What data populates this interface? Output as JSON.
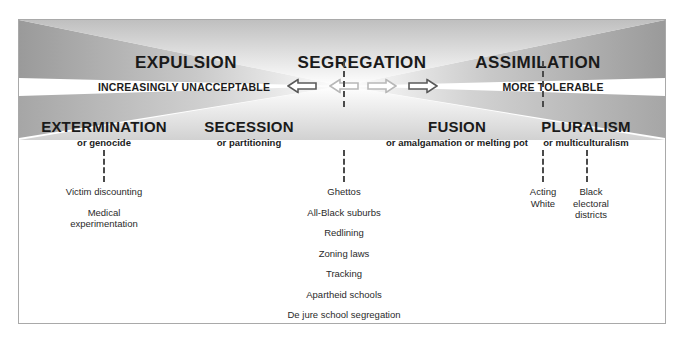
{
  "diagram": {
    "title_row": [
      {
        "label": "EXPULSION",
        "x": 167,
        "y": 44
      },
      {
        "label": "SEGREGATION",
        "x": 343,
        "y": 44
      },
      {
        "label": "ASSIMILATION",
        "x": 519,
        "y": 44
      }
    ],
    "scale_labels": [
      {
        "label": "INCREASINGLY UNACCEPTABLE",
        "x": 165,
        "y": 84
      },
      {
        "label": "MORE TOLERABLE",
        "x": 534,
        "y": 84
      }
    ],
    "arrows": [
      {
        "name": "arrow-left-outer",
        "direction": "left",
        "x": 283,
        "y": 85,
        "tone": "dark"
      },
      {
        "name": "arrow-left-inner",
        "direction": "left",
        "x": 325,
        "y": 85,
        "tone": "light"
      },
      {
        "name": "arrow-right-inner",
        "direction": "right",
        "x": 363,
        "y": 85,
        "tone": "light"
      },
      {
        "name": "arrow-right-outer",
        "direction": "right",
        "x": 404,
        "y": 85,
        "tone": "dark"
      }
    ],
    "category_row": [
      {
        "name": "extermination",
        "main": "EXTERMINATION",
        "sub": "or genocide",
        "x": 103,
        "y": 118
      },
      {
        "name": "secession",
        "main": "SECESSION",
        "sub": "or partitioning",
        "x": 248,
        "y": 118
      },
      {
        "name": "fusion",
        "main": "FUSION",
        "sub": "or amalgamation or melting pot",
        "x": 456,
        "y": 118
      },
      {
        "name": "pluralism",
        "main": "PLURALISM",
        "sub": "or multiculturalism",
        "x": 585,
        "y": 118
      }
    ],
    "connectors": [
      {
        "name": "connector-segregation-top",
        "x": 343,
        "y": 62,
        "height": 46
      },
      {
        "name": "connector-assimilation-top",
        "x": 542,
        "y": 62,
        "height": 46
      },
      {
        "name": "connector-extermination",
        "x": 103,
        "y": 148,
        "height": 32
      },
      {
        "name": "connector-segregation-bottom",
        "x": 343,
        "y": 148,
        "height": 32
      },
      {
        "name": "connector-fusion",
        "x": 542,
        "y": 148,
        "height": 32
      },
      {
        "name": "connector-pluralism",
        "x": 586,
        "y": 148,
        "height": 32
      }
    ],
    "example_columns": [
      {
        "name": "examples-extermination",
        "x": 103,
        "y": 185,
        "width": 150,
        "items": [
          "Victim discounting",
          "Medical\nexperimentation"
        ]
      },
      {
        "name": "examples-segregation",
        "x": 343,
        "y": 185,
        "width": 220,
        "items": [
          "Ghettos",
          "All-Black suburbs",
          "Redlining",
          "Zoning laws",
          "Tracking",
          "Apartheid schools",
          "De jure school segregation"
        ]
      },
      {
        "name": "examples-assimilation",
        "x": 542,
        "y": 185,
        "width": 46,
        "items": [
          "Acting\nWhite"
        ]
      },
      {
        "name": "examples-pluralism",
        "x": 590,
        "y": 185,
        "width": 56,
        "items": [
          "Black\nelectoral\ndistricts"
        ]
      }
    ],
    "colors": {
      "frame_border": "#a9a9a9",
      "text_dark": "#1a1a1a",
      "text_body": "#2a2a2a",
      "dash_line": "#4a4a4a",
      "shade_dark": "#9a9a9a",
      "shade_light": "#ffffff",
      "arrow_dark": "#5a5a5a",
      "arrow_light": "#b8b8b8"
    }
  }
}
